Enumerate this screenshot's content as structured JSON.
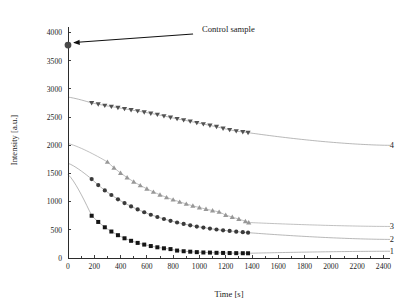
{
  "chart_data": {
    "type": "scatter",
    "title": "",
    "xlabel": "Time [s]",
    "ylabel": "Intensity [a.u.]",
    "xlim": [
      0,
      2450
    ],
    "ylim": [
      0,
      4100
    ],
    "xticks": [
      0,
      200,
      400,
      600,
      800,
      1000,
      1200,
      1400,
      1600,
      1800,
      2000,
      2200,
      2400
    ],
    "yticks": [
      0,
      500,
      1000,
      1500,
      2000,
      2500,
      3000,
      3500,
      4000
    ],
    "grid": false,
    "legend": "inline-right-labels",
    "annotations": [
      {
        "name": "control-sample",
        "text": "Control sample",
        "point_x": 0,
        "point_y": 3780,
        "text_x": 1020,
        "text_y": 4010,
        "marker": "circle",
        "color": "#4a4a4a"
      }
    ],
    "series": [
      {
        "name": "1",
        "label": "1",
        "marker": "square",
        "color": "#151515",
        "line_color": "#9a9a9a",
        "label_x": 2380,
        "label_y": 120,
        "fit_y_at_zero": 1480,
        "points": [
          {
            "x": 180,
            "y": 750
          },
          {
            "x": 230,
            "y": 640
          },
          {
            "x": 280,
            "y": 545
          },
          {
            "x": 330,
            "y": 470
          },
          {
            "x": 380,
            "y": 405
          },
          {
            "x": 430,
            "y": 350
          },
          {
            "x": 480,
            "y": 305
          },
          {
            "x": 530,
            "y": 268
          },
          {
            "x": 580,
            "y": 238
          },
          {
            "x": 630,
            "y": 212
          },
          {
            "x": 680,
            "y": 190
          },
          {
            "x": 730,
            "y": 172
          },
          {
            "x": 780,
            "y": 158
          },
          {
            "x": 830,
            "y": 132
          },
          {
            "x": 880,
            "y": 120
          },
          {
            "x": 930,
            "y": 112
          },
          {
            "x": 980,
            "y": 104
          },
          {
            "x": 1030,
            "y": 98
          },
          {
            "x": 1080,
            "y": 96
          },
          {
            "x": 1130,
            "y": 92
          },
          {
            "x": 1180,
            "y": 90
          },
          {
            "x": 1230,
            "y": 88
          },
          {
            "x": 1280,
            "y": 86
          },
          {
            "x": 1330,
            "y": 85
          },
          {
            "x": 1370,
            "y": 84
          }
        ]
      },
      {
        "name": "2",
        "label": "2",
        "marker": "circle",
        "color": "#3a3a3a",
        "line_color": "#9a9a9a",
        "label_x": 2380,
        "label_y": 330,
        "fit_y_at_zero": 1680,
        "points": [
          {
            "x": 180,
            "y": 1400
          },
          {
            "x": 230,
            "y": 1295
          },
          {
            "x": 280,
            "y": 1200
          },
          {
            "x": 330,
            "y": 1118
          },
          {
            "x": 380,
            "y": 1042
          },
          {
            "x": 430,
            "y": 975
          },
          {
            "x": 480,
            "y": 915
          },
          {
            "x": 530,
            "y": 862
          },
          {
            "x": 580,
            "y": 812
          },
          {
            "x": 630,
            "y": 768
          },
          {
            "x": 680,
            "y": 728
          },
          {
            "x": 730,
            "y": 692
          },
          {
            "x": 780,
            "y": 660
          },
          {
            "x": 830,
            "y": 630
          },
          {
            "x": 880,
            "y": 604
          },
          {
            "x": 930,
            "y": 580
          },
          {
            "x": 980,
            "y": 558
          },
          {
            "x": 1030,
            "y": 540
          },
          {
            "x": 1080,
            "y": 522
          },
          {
            "x": 1130,
            "y": 506
          },
          {
            "x": 1180,
            "y": 492
          },
          {
            "x": 1230,
            "y": 480
          },
          {
            "x": 1280,
            "y": 468
          },
          {
            "x": 1330,
            "y": 458
          },
          {
            "x": 1370,
            "y": 450
          }
        ]
      },
      {
        "name": "3",
        "label": "3",
        "marker": "triangle-up",
        "color": "#989898",
        "line_color": "#a6a6a6",
        "label_x": 2380,
        "label_y": 560,
        "fit_y_at_zero": 2030,
        "points": [
          {
            "x": 300,
            "y": 1705
          },
          {
            "x": 350,
            "y": 1600
          },
          {
            "x": 400,
            "y": 1508
          },
          {
            "x": 450,
            "y": 1428
          },
          {
            "x": 500,
            "y": 1352
          },
          {
            "x": 550,
            "y": 1288
          },
          {
            "x": 600,
            "y": 1228
          },
          {
            "x": 650,
            "y": 1172
          },
          {
            "x": 700,
            "y": 1122
          },
          {
            "x": 750,
            "y": 1076
          },
          {
            "x": 800,
            "y": 1034
          },
          {
            "x": 850,
            "y": 996
          },
          {
            "x": 900,
            "y": 960
          },
          {
            "x": 950,
            "y": 926
          },
          {
            "x": 1000,
            "y": 896
          },
          {
            "x": 1050,
            "y": 868
          },
          {
            "x": 1100,
            "y": 842
          },
          {
            "x": 1150,
            "y": 818
          },
          {
            "x": 1200,
            "y": 762
          },
          {
            "x": 1250,
            "y": 726
          },
          {
            "x": 1300,
            "y": 690
          },
          {
            "x": 1350,
            "y": 652
          },
          {
            "x": 1375,
            "y": 630
          }
        ]
      },
      {
        "name": "4",
        "label": "4",
        "marker": "triangle-down",
        "color": "#525252",
        "line_color": "#9a9a9a",
        "label_x": 2380,
        "label_y": 2000,
        "fit_y_at_zero": 2855,
        "points": [
          {
            "x": 180,
            "y": 2752
          },
          {
            "x": 230,
            "y": 2730
          },
          {
            "x": 280,
            "y": 2705
          },
          {
            "x": 330,
            "y": 2688
          },
          {
            "x": 380,
            "y": 2668
          },
          {
            "x": 430,
            "y": 2648
          },
          {
            "x": 480,
            "y": 2628
          },
          {
            "x": 530,
            "y": 2608
          },
          {
            "x": 580,
            "y": 2588
          },
          {
            "x": 630,
            "y": 2566
          },
          {
            "x": 680,
            "y": 2545
          },
          {
            "x": 730,
            "y": 2520
          },
          {
            "x": 780,
            "y": 2495
          },
          {
            "x": 830,
            "y": 2470
          },
          {
            "x": 880,
            "y": 2448
          },
          {
            "x": 930,
            "y": 2425
          },
          {
            "x": 980,
            "y": 2400
          },
          {
            "x": 1030,
            "y": 2378
          },
          {
            "x": 1080,
            "y": 2352
          },
          {
            "x": 1130,
            "y": 2330
          },
          {
            "x": 1180,
            "y": 2300
          },
          {
            "x": 1230,
            "y": 2275
          },
          {
            "x": 1280,
            "y": 2252
          },
          {
            "x": 1330,
            "y": 2238
          },
          {
            "x": 1370,
            "y": 2225
          }
        ]
      }
    ]
  }
}
